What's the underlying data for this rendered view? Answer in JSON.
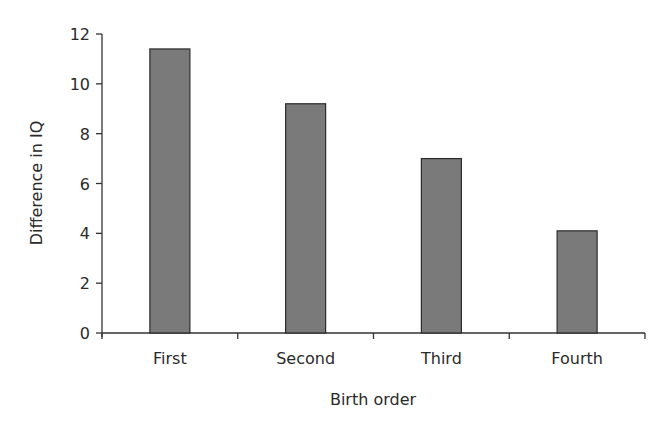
{
  "chart_data": {
    "type": "bar",
    "title": "",
    "xlabel": "Birth order",
    "ylabel": "Difference in IQ",
    "categories": [
      "First",
      "Second",
      "Third",
      "Fourth"
    ],
    "values": [
      11.4,
      9.2,
      7.0,
      4.1
    ],
    "ylim": [
      0,
      12
    ],
    "yticks": [
      0,
      2,
      4,
      6,
      8,
      10,
      12
    ],
    "grid": false,
    "legend": null,
    "bar_color": "#7a7a7a",
    "bar_edge_color": "#2a2a2a"
  }
}
